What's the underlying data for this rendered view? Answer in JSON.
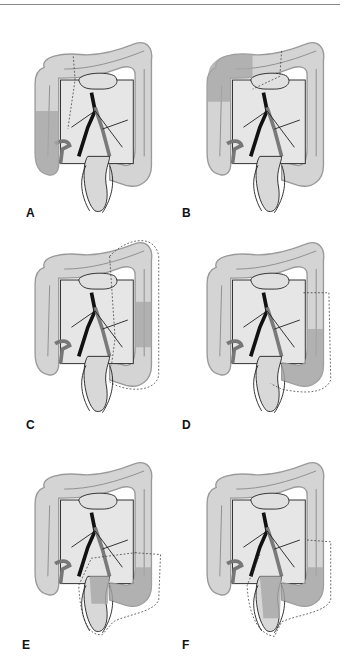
{
  "figure": {
    "colors": {
      "colon_fill": "#d4d4d4",
      "colon_outline": "#9a9a9a",
      "resected_fill": "#a8a8a8",
      "vessel_dark": "#111111",
      "vessel_mid": "#7a7a7a",
      "mesentery_fill": "#e6e6e6",
      "stroke": "#222222"
    },
    "panels": [
      {
        "label": "A",
        "resection": "right"
      },
      {
        "label": "B",
        "resection": "transverse"
      },
      {
        "label": "C",
        "resection": "left"
      },
      {
        "label": "D",
        "resection": "sigmoid-left"
      },
      {
        "label": "E",
        "resection": "sigmoid-rectal"
      },
      {
        "label": "F",
        "resection": "low-anterior"
      }
    ]
  }
}
